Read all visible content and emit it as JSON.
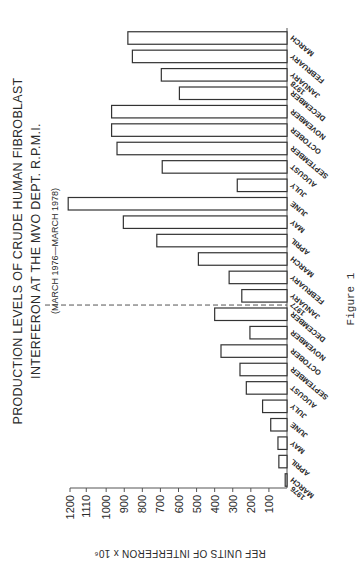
{
  "chart_data": {
    "type": "bar",
    "orientation": "vertical (image rotated 90° counter-clockwise)",
    "title": "PRODUCTION LEVELS OF CRUDE HUMAN FIBROBLAST",
    "title_line2": "INTERFERON AT THE MVO DEPT. R.P.M.I.",
    "subtitle": "(MARCH 1976—MARCH 1978)",
    "xlabel": "",
    "ylabel": "REF UNITS OF INTERFERON x 10⁶",
    "ylim": [
      0,
      1200
    ],
    "yticks": [
      100,
      200,
      300,
      400,
      500,
      600,
      700,
      800,
      900,
      1000,
      1110,
      1200
    ],
    "grid": false,
    "year_divider_after_index": 9,
    "categories": [
      {
        "label": "MARCH",
        "year": "1976"
      },
      {
        "label": "APRIL",
        "year": ""
      },
      {
        "label": "MAY",
        "year": ""
      },
      {
        "label": "JUNE",
        "year": ""
      },
      {
        "label": "JULY",
        "year": ""
      },
      {
        "label": "AUGUST",
        "year": ""
      },
      {
        "label": "SEPTEMBER",
        "year": ""
      },
      {
        "label": "OCTOBER",
        "year": ""
      },
      {
        "label": "NOVEMBER",
        "year": ""
      },
      {
        "label": "DECEMBER",
        "year": ""
      },
      {
        "label": "JANUARY",
        "year": "1977"
      },
      {
        "label": "FEBRUARY",
        "year": ""
      },
      {
        "label": "MARCH",
        "year": ""
      },
      {
        "label": "APRIL",
        "year": ""
      },
      {
        "label": "MAY",
        "year": ""
      },
      {
        "label": "JUNE",
        "year": ""
      },
      {
        "label": "JULY",
        "year": ""
      },
      {
        "label": "AUGUST",
        "year": ""
      },
      {
        "label": "SEPTEMBER",
        "year": ""
      },
      {
        "label": "OCTOBER",
        "year": ""
      },
      {
        "label": "NOVEMBER",
        "year": ""
      },
      {
        "label": "DECEMBER",
        "year": ""
      },
      {
        "label": "JANUARY",
        "year": "1978"
      },
      {
        "label": "FEBRUARY",
        "year": ""
      },
      {
        "label": "MARCH",
        "year": ""
      }
    ],
    "values": [
      10,
      45,
      50,
      90,
      135,
      225,
      260,
      365,
      205,
      400,
      250,
      320,
      490,
      720,
      905,
      1210,
      275,
      690,
      940,
      970,
      970,
      595,
      695,
      855,
      880
    ]
  },
  "caption": "Figure 1"
}
